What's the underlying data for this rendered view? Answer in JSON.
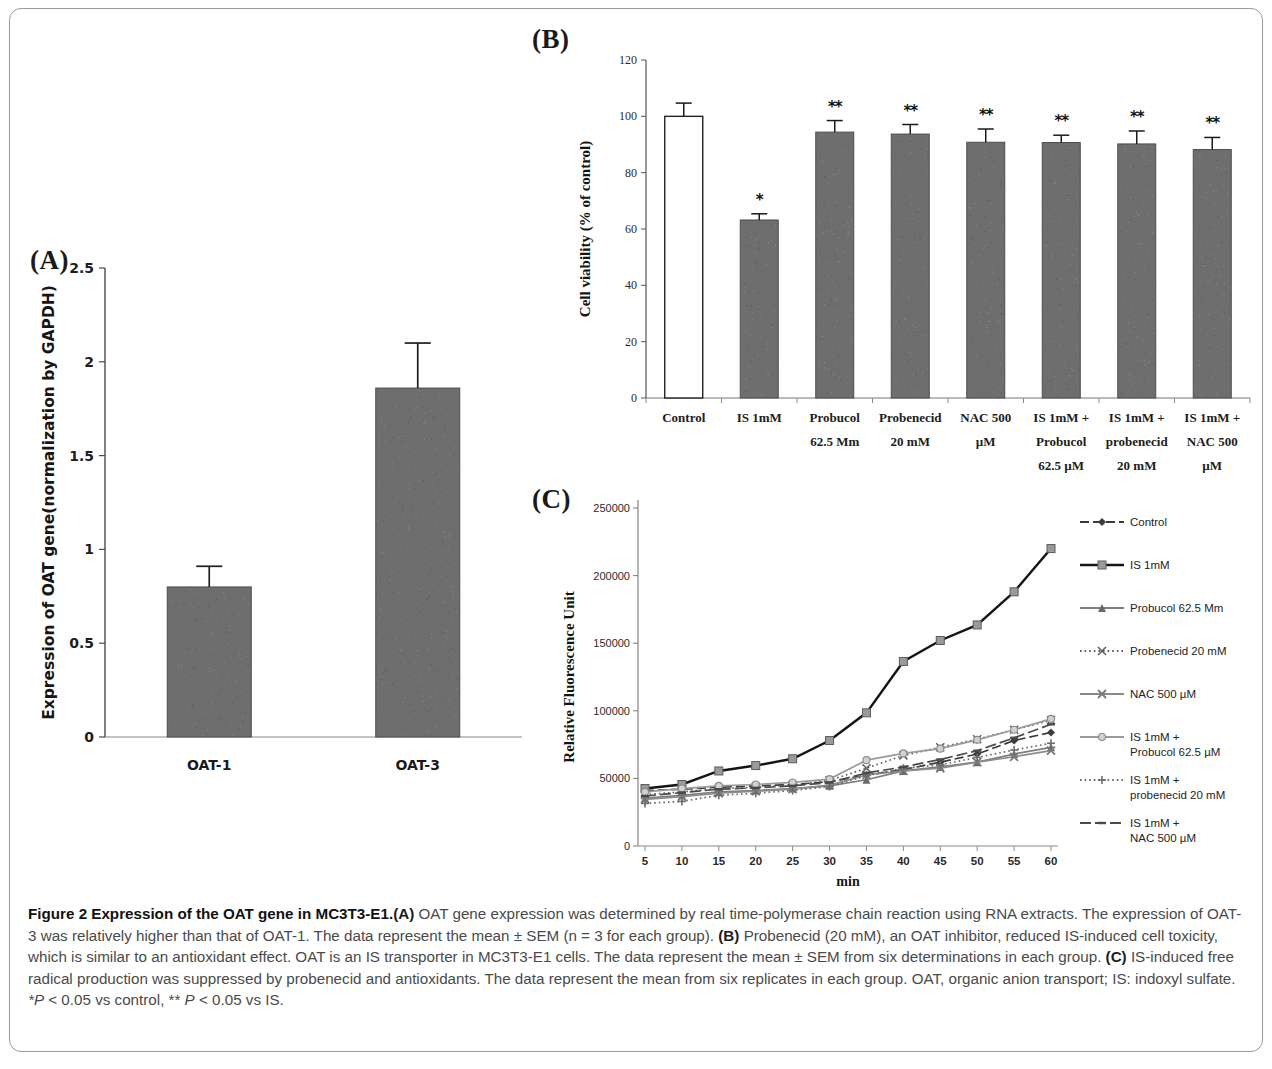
{
  "figure": {
    "panel_a_letter": "(A)",
    "panel_b_letter": "(B)",
    "panel_c_letter": "(C)"
  },
  "caption": {
    "title": "Figure 2 Expression of the OAT gene in MC3T3-E1.",
    "a_tag": "(A)",
    "a_text": " OAT gene expression was determined by real time-polymerase chain reaction using RNA extracts. The expression of OAT-3 was relatively higher than that of OAT-1. The data represent the mean ± SEM (n = 3 for each group). ",
    "b_tag": "(B)",
    "b_text": " Probenecid (20 mM), an OAT inhibitor, reduced IS-induced cell toxicity, which is similar to an antioxidant effect. OAT is an IS transporter in MC3T3-E1 cells. The data represent the mean ± SEM from six determinations in each group. ",
    "c_tag": "(C)",
    "c_text": " IS-induced free radical production was suppressed by probenecid and antioxidants. The data represent the mean from six replicates in each group. OAT, organic anion transport; IS: indoxyl sulfate. ",
    "footnote_p1": "*P",
    "footnote_rest1": " < 0.05 vs control, ** ",
    "footnote_p2": "P",
    "footnote_rest2": " < 0.05 vs IS."
  },
  "chart_data": [
    {
      "id": "panel_a",
      "type": "bar",
      "title": "(A)",
      "xlabel": "",
      "ylabel": "Expression of OAT gene(normalization by GAPDH)",
      "ylim": [
        0,
        2.5
      ],
      "yticks": [
        "0",
        "0.5",
        "1",
        "1.5",
        "2",
        "2.5"
      ],
      "ytick_values": [
        0,
        0.5,
        1,
        1.5,
        2,
        2.5
      ],
      "grid": false,
      "categories": [
        "OAT-1",
        "OAT-3"
      ],
      "values": [
        0.8,
        1.86
      ],
      "errors": [
        0.11,
        0.24
      ],
      "bar_fill": "#6e6e6e"
    },
    {
      "id": "panel_b",
      "type": "bar",
      "title": "(B)",
      "xlabel": "",
      "ylabel": "Cell viability (% of control)",
      "ylim": [
        0,
        120
      ],
      "yticks": [
        "0",
        "20",
        "40",
        "60",
        "80",
        "100",
        "120"
      ],
      "ytick_values": [
        0,
        20,
        40,
        60,
        80,
        100,
        120
      ],
      "grid": false,
      "categories": [
        "Control",
        "IS 1mM",
        "Probucol\n62.5 Mm",
        "Probenecid\n20 mM",
        "NAC 500\nµM",
        "IS 1mM +\nProbucol\n62.5 µM",
        "IS 1mM +\nprobenecid\n20 mM",
        "IS 1mM +\nNAC 500\nµM"
      ],
      "values": [
        100.0,
        63.2,
        94.4,
        93.7,
        90.8,
        90.7,
        90.2,
        88.2
      ],
      "errors": [
        4.7,
        2.2,
        4.1,
        3.4,
        4.7,
        2.6,
        4.6,
        4.3
      ],
      "significance": [
        "",
        "*",
        "**",
        "**",
        "**",
        "**",
        "**",
        "**"
      ],
      "hollow_bars": [
        0
      ],
      "bar_fill": "#6e6e6e"
    },
    {
      "id": "panel_c",
      "type": "line",
      "title": "(C)",
      "xlabel": "min",
      "ylabel": "Relative Fluorescence Unit",
      "x": [
        5,
        10,
        15,
        20,
        25,
        30,
        35,
        40,
        45,
        50,
        55,
        60
      ],
      "xticks": [
        "5",
        "10",
        "15",
        "20",
        "25",
        "30",
        "35",
        "40",
        "45",
        "50",
        "55",
        "60"
      ],
      "yticks": [
        "0",
        "50000",
        "100000",
        "150000",
        "200000",
        "250000"
      ],
      "ytick_values": [
        0,
        50000,
        100000,
        150000,
        200000,
        250000
      ],
      "ylim": [
        0,
        250000
      ],
      "grid": false,
      "legend_position": "right",
      "series": [
        {
          "name": "Control",
          "marker": "diamond",
          "dash": "dashed",
          "values": [
            41000,
            42000,
            43500,
            44500,
            45500,
            47500,
            52500,
            56500,
            62000,
            68000,
            78000,
            84000
          ]
        },
        {
          "name": "IS 1mM",
          "marker": "square",
          "dash": "solid",
          "values": [
            42500,
            45500,
            55500,
            59500,
            64500,
            78000,
            98500,
            136500,
            152000,
            163500,
            188000,
            220000
          ]
        },
        {
          "name": "Probucol  62.5 Mm",
          "marker": "triangle",
          "dash": "solid",
          "values": [
            35500,
            37500,
            40000,
            41000,
            42500,
            44500,
            49000,
            55500,
            58500,
            62000,
            68000,
            73000
          ]
        },
        {
          "name": "Probenecid 20 mM",
          "marker": "cross",
          "dash": "dotted",
          "values": [
            38000,
            40000,
            42500,
            43500,
            45000,
            48500,
            57500,
            67000,
            73000,
            79000,
            86000,
            93000
          ]
        },
        {
          "name": "NAC 500 µM",
          "marker": "x",
          "dash": "solid",
          "values": [
            34500,
            36500,
            39000,
            40500,
            42000,
            45000,
            52500,
            55500,
            57500,
            62000,
            66000,
            70500
          ]
        },
        {
          "name": "IS 1mM +\nProbucol  62.5 µM",
          "marker": "circle",
          "dash": "solid",
          "values": [
            40000,
            42500,
            44500,
            45500,
            47000,
            49500,
            63500,
            68500,
            72000,
            78500,
            86000,
            94000
          ]
        },
        {
          "name": "IS 1mM +\nprobenecid 20 mM",
          "marker": "plus",
          "dash": "dotted",
          "values": [
            31500,
            33000,
            37500,
            39000,
            41000,
            44000,
            52000,
            57500,
            60000,
            65500,
            71000,
            76000
          ]
        },
        {
          "name": "IS 1mM +\nNAC 500 µM",
          "marker": "dash",
          "dash": "dashdot",
          "values": [
            37000,
            39500,
            42000,
            43000,
            44500,
            47000,
            54000,
            58500,
            64000,
            70500,
            80000,
            90000
          ]
        }
      ]
    }
  ]
}
